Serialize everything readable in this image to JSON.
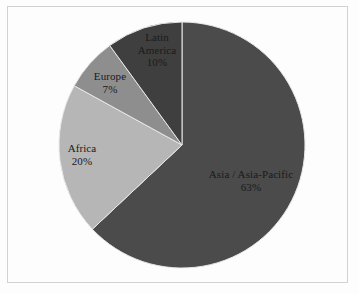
{
  "chart_data": {
    "type": "pie",
    "title": "",
    "categories": [
      "Asia / Asia-Pacific",
      "Africa",
      "Latin America",
      "Europe"
    ],
    "values": [
      63,
      20,
      10,
      7
    ],
    "unit": "%",
    "legend": "none",
    "start_angle_deg": 0,
    "direction": "clockwise",
    "slices": [
      {
        "label": "Asia / Asia-Pacific",
        "value": 63,
        "value_label": "63%",
        "color": "#4b4b4b",
        "start_deg": 0,
        "end_deg": 226.8
      },
      {
        "label": "Africa",
        "value": 20,
        "value_label": "20%",
        "color": "#b6b6b6",
        "start_deg": 226.8,
        "end_deg": 298.8
      },
      {
        "label": "Europe",
        "value": 7,
        "value_label": "7%",
        "color": "#8e8e8e",
        "start_deg": 298.8,
        "end_deg": 324.0
      },
      {
        "label": "Latin America",
        "value": 10,
        "value_label": "10%",
        "color": "#3f3f3f",
        "start_deg": 324.0,
        "end_deg": 360.0
      }
    ]
  },
  "labels": {
    "asia": {
      "name": "Asia / Asia-Pacific",
      "pct": "63%"
    },
    "africa": {
      "name": "Africa",
      "pct": "20%"
    },
    "europe": {
      "name": "Europe",
      "pct": "7%"
    },
    "latin": {
      "name_line1": "Latin",
      "name_line2": "America",
      "pct": "10%"
    }
  },
  "colors": {
    "background": "#fdfdfd",
    "frame_border": "#d2d2d2",
    "slice_divider": "#e8e8e8",
    "label_text": "#1a1a1a"
  },
  "geometry": {
    "center_x": 182,
    "center_y": 145,
    "radius": 123
  }
}
